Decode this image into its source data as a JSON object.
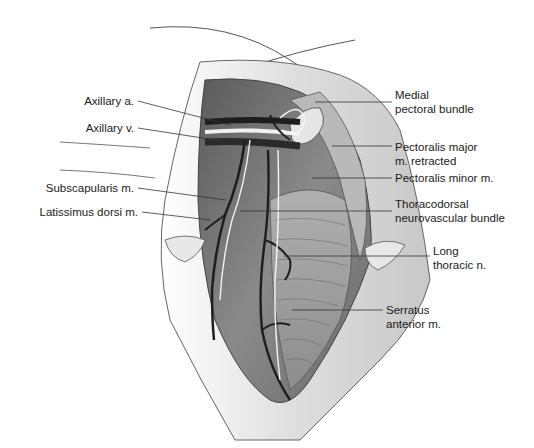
{
  "figure": {
    "type": "anatomical illustration",
    "colors": {
      "background": "#ffffff",
      "muscle": "#7a7a7a",
      "skin": "#dcdcdc",
      "vessel": "#1e1e1e",
      "nerve": "#f2f2f2",
      "leader": "#333333"
    }
  },
  "labels": {
    "left": [
      {
        "id": "axillary-artery",
        "line1": "Axillary a."
      },
      {
        "id": "axillary-vein",
        "line1": "Axillary v."
      },
      {
        "id": "subscapularis",
        "line1": "Subscapularis m."
      },
      {
        "id": "latissimus-dorsi",
        "line1": "Latissimus dorsi m."
      }
    ],
    "right": [
      {
        "id": "medial-pectoral-bundle",
        "line1": "Medial",
        "line2": "pectoral bundle"
      },
      {
        "id": "pectoralis-major",
        "line1": "Pectoralis major",
        "line2": "m. retracted"
      },
      {
        "id": "pectoralis-minor",
        "line1": "Pectoralis minor m."
      },
      {
        "id": "thoracodorsal",
        "line1": "Thoracodorsal",
        "line2": "neurovascular bundle"
      },
      {
        "id": "long-thoracic",
        "line1": "Long",
        "line2": "thoracic n."
      },
      {
        "id": "serratus-anterior",
        "line1": "Serratus",
        "line2": "anterior m."
      }
    ]
  }
}
